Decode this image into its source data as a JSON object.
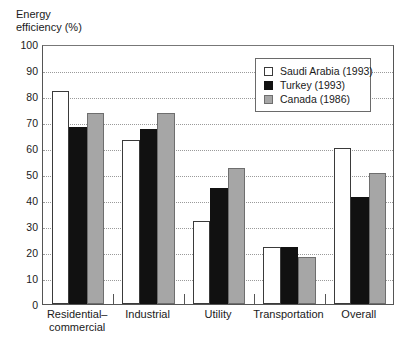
{
  "chart_data": {
    "type": "bar",
    "title": "Energy\nefficiency (%)",
    "xlabel": "",
    "ylabel": "Energy efficiency (%)",
    "ylim": [
      0,
      100
    ],
    "yticks": [
      100,
      90,
      80,
      70,
      60,
      50,
      40,
      30,
      20,
      10,
      0
    ],
    "grid": true,
    "legend_position": "top-right",
    "categories": [
      "Residential–\ncommercial",
      "Industrial",
      "Utility",
      "Transportation",
      "Overall"
    ],
    "series": [
      {
        "name": "Saudi Arabia (1993)",
        "color": "#ffffff",
        "edge_color": "#3a3a3a",
        "values": [
          82,
          63,
          32,
          22,
          60
        ]
      },
      {
        "name": "Turkey (1993)",
        "color": "#111111",
        "edge_color": "#111111",
        "values": [
          68,
          67.5,
          44.5,
          22,
          41
        ]
      },
      {
        "name": "Canada (1986)",
        "color": "#a6a6a6",
        "edge_color": "#6e6e6e",
        "values": [
          73.5,
          73.5,
          52.5,
          18,
          50.5
        ]
      }
    ]
  },
  "legend": {
    "items": [
      {
        "label": "Saudi Arabia (1993)",
        "key": "saudi"
      },
      {
        "label": "Turkey (1993)",
        "key": "turkey"
      },
      {
        "label": "Canada (1986)",
        "key": "canada"
      }
    ]
  }
}
